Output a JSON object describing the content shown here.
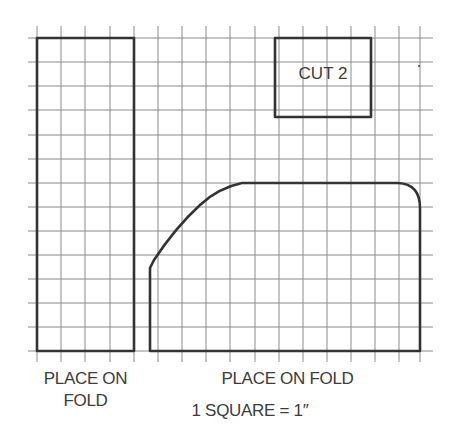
{
  "diagram": {
    "type": "sewing-pattern-grid",
    "grid": {
      "square_px": 24.15,
      "origin_x": 37,
      "origin_y": 38,
      "columns": 16,
      "rows": 13,
      "line_color": "#8a8a8a",
      "outline_color": "#333333"
    },
    "pieces": [
      {
        "id": "left-strip",
        "label": "PLACE ON\nFOLD",
        "label_line1": "PLACE ON",
        "label_line2": "FOLD",
        "width_squares": 4,
        "height_squares": 13
      },
      {
        "id": "small-rectangle",
        "label": "CUT 2",
        "width_squares": 4,
        "height_squares": 3.3
      },
      {
        "id": "main-piece",
        "label": "PLACE ON FOLD",
        "width_squares": 11.2,
        "height_squares": 7
      }
    ],
    "scale_note": "1 SQUARE = 1″"
  }
}
